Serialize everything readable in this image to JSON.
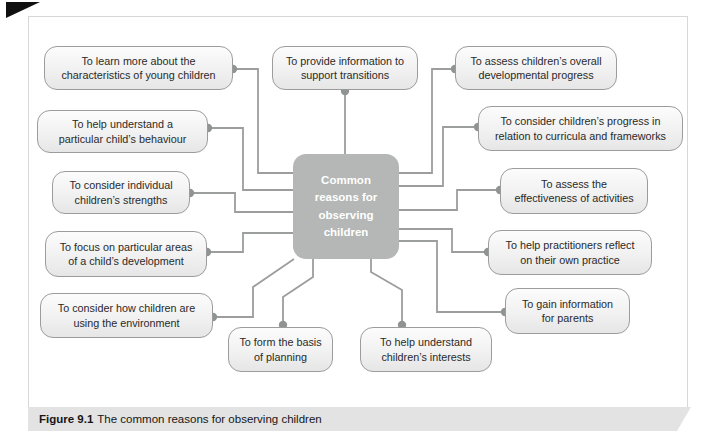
{
  "figure": {
    "caption": {
      "label": "Figure 9.1",
      "text": "The common reasons for observing children"
    }
  },
  "diagram": {
    "center": {
      "lines": [
        "Common",
        "reasons for",
        "observing",
        "children"
      ]
    },
    "nodes": [
      {
        "id": "learn-more",
        "lines": [
          "To learn more about the",
          "characteristics of young children"
        ]
      },
      {
        "id": "provide-information",
        "lines": [
          "To provide information to",
          "support transitions"
        ]
      },
      {
        "id": "assess-overall",
        "lines": [
          "To assess children’s overall",
          "developmental progress"
        ]
      },
      {
        "id": "understand-behaviour",
        "lines": [
          "To help understand a",
          "particular child’s behaviour"
        ]
      },
      {
        "id": "consider-progress",
        "lines": [
          "To consider children’s progress in",
          "relation to curricula and frameworks"
        ]
      },
      {
        "id": "consider-strengths",
        "lines": [
          "To consider individual",
          "children’s strengths"
        ]
      },
      {
        "id": "assess-effectiveness",
        "lines": [
          "To assess the",
          "effectiveness of activities"
        ]
      },
      {
        "id": "focus-areas",
        "lines": [
          "To focus on particular areas",
          "of a child’s development"
        ]
      },
      {
        "id": "practitioners-reflect",
        "lines": [
          "To help practitioners reflect",
          "on their own practice"
        ]
      },
      {
        "id": "consider-environment",
        "lines": [
          "To consider how children are",
          "using the environment"
        ]
      },
      {
        "id": "gain-information",
        "lines": [
          "To gain information",
          "for parents"
        ]
      },
      {
        "id": "form-basis-planning",
        "lines": [
          "To form the basis",
          "of planning"
        ]
      },
      {
        "id": "understand-interests",
        "lines": [
          "To help understand",
          "children’s interests"
        ]
      }
    ],
    "colors": {
      "center_fill": "#b4b7b5",
      "box_border": "#9c9c9c",
      "connector": "#9b9e9c",
      "dot": "#8f9391",
      "caption_band": "#e3e3e3"
    }
  }
}
